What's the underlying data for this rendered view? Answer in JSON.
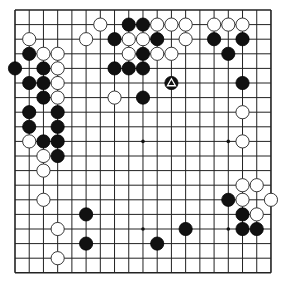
{
  "game": "Go",
  "board": {
    "size": 19,
    "origin": {
      "x": 15,
      "y": 10
    },
    "spacing": {
      "x": 14.22,
      "y": 14.6
    },
    "line_color": "#222222",
    "background": "#ffffff",
    "star_points": [
      [
        3,
        3
      ],
      [
        9,
        3
      ],
      [
        15,
        3
      ],
      [
        3,
        9
      ],
      [
        9,
        9
      ],
      [
        15,
        9
      ],
      [
        3,
        15
      ],
      [
        9,
        15
      ],
      [
        15,
        15
      ]
    ]
  },
  "stones": {
    "black": [
      [
        8,
        1
      ],
      [
        9,
        1
      ],
      [
        7,
        2
      ],
      [
        10,
        2
      ],
      [
        9,
        3
      ],
      [
        7,
        4
      ],
      [
        8,
        4
      ],
      [
        9,
        4
      ],
      [
        11,
        5
      ],
      [
        9,
        6
      ],
      [
        14,
        2
      ],
      [
        16,
        2
      ],
      [
        15,
        3
      ],
      [
        16,
        5
      ],
      [
        1,
        3
      ],
      [
        0,
        4
      ],
      [
        2,
        4
      ],
      [
        1,
        5
      ],
      [
        2,
        5
      ],
      [
        2,
        6
      ],
      [
        1,
        7
      ],
      [
        3,
        7
      ],
      [
        1,
        8
      ],
      [
        3,
        8
      ],
      [
        2,
        9
      ],
      [
        3,
        9
      ],
      [
        3,
        10
      ],
      [
        5,
        14
      ],
      [
        5,
        16
      ],
      [
        12,
        15
      ],
      [
        10,
        16
      ],
      [
        15,
        13
      ],
      [
        16,
        14
      ],
      [
        16,
        15
      ],
      [
        17,
        15
      ]
    ],
    "white": [
      [
        6,
        1
      ],
      [
        10,
        1
      ],
      [
        11,
        1
      ],
      [
        12,
        1
      ],
      [
        14,
        1
      ],
      [
        15,
        1
      ],
      [
        16,
        1
      ],
      [
        1,
        2
      ],
      [
        5,
        2
      ],
      [
        8,
        2
      ],
      [
        9,
        2
      ],
      [
        12,
        2
      ],
      [
        2,
        3
      ],
      [
        3,
        3
      ],
      [
        8,
        3
      ],
      [
        10,
        3
      ],
      [
        11,
        3
      ],
      [
        3,
        4
      ],
      [
        3,
        5
      ],
      [
        3,
        6
      ],
      [
        7,
        6
      ],
      [
        1,
        9
      ],
      [
        2,
        10
      ],
      [
        2,
        11
      ],
      [
        2,
        13
      ],
      [
        3,
        15
      ],
      [
        3,
        17
      ],
      [
        16,
        7
      ],
      [
        16,
        9
      ],
      [
        16,
        12
      ],
      [
        17,
        12
      ],
      [
        16,
        13
      ],
      [
        18,
        13
      ],
      [
        17,
        14
      ]
    ]
  },
  "last_move": {
    "color": "black",
    "point": [
      11,
      5
    ],
    "marker": "triangle"
  }
}
